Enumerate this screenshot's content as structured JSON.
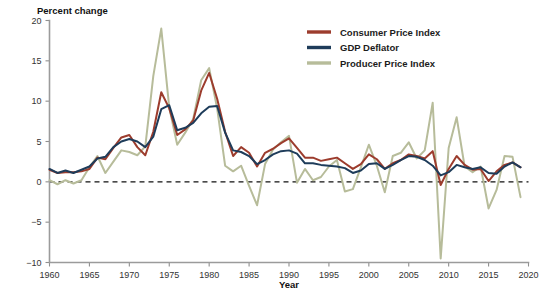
{
  "chart_data": {
    "type": "line",
    "title": "",
    "ylabel": "Percent change",
    "xlabel": "Year",
    "xlim": [
      1960,
      2020
    ],
    "ylim": [
      -10,
      20
    ],
    "xticks": [
      1960,
      1965,
      1970,
      1975,
      1980,
      1985,
      1990,
      1995,
      2000,
      2005,
      2010,
      2015,
      2020
    ],
    "yticks": [
      -10,
      -5,
      0,
      5,
      10,
      15,
      20
    ],
    "xtick_labels": [
      "1960",
      "1965",
      "1970",
      "1975",
      "1980",
      "1985",
      "1990",
      "1995",
      "2000",
      "2005",
      "2010",
      "2015",
      "2020"
    ],
    "ytick_labels": [
      "−10",
      "−5",
      "0",
      "5",
      "10",
      "15",
      "20"
    ],
    "grid": false,
    "zero_reference_line": 0,
    "legend_position": "top-right",
    "x": [
      1960,
      1961,
      1962,
      1963,
      1964,
      1965,
      1966,
      1967,
      1968,
      1969,
      1970,
      1971,
      1972,
      1973,
      1974,
      1975,
      1976,
      1977,
      1978,
      1979,
      1980,
      1981,
      1982,
      1983,
      1984,
      1985,
      1986,
      1987,
      1988,
      1989,
      1990,
      1991,
      1992,
      1993,
      1994,
      1995,
      1996,
      1997,
      1998,
      1999,
      2000,
      2001,
      2002,
      2003,
      2004,
      2005,
      2006,
      2007,
      2008,
      2009,
      2010,
      2011,
      2012,
      2013,
      2014,
      2015,
      2016,
      2017,
      2018,
      2019
    ],
    "series": [
      {
        "name": "Consumer Price Index",
        "color": "#9c3c2d",
        "values": [
          1.5,
          1.1,
          1.2,
          1.2,
          1.3,
          1.6,
          3.0,
          2.8,
          4.2,
          5.5,
          5.8,
          4.3,
          3.3,
          6.2,
          11.1,
          9.1,
          5.8,
          6.5,
          7.6,
          11.3,
          13.5,
          10.3,
          6.2,
          3.2,
          4.3,
          3.6,
          1.9,
          3.6,
          4.1,
          4.8,
          5.4,
          4.2,
          3.0,
          3.0,
          2.6,
          2.8,
          3.0,
          2.3,
          1.6,
          2.2,
          3.4,
          2.8,
          1.6,
          2.3,
          2.7,
          3.4,
          3.2,
          2.9,
          3.8,
          -0.4,
          1.6,
          3.2,
          2.1,
          1.5,
          1.6,
          0.1,
          1.3,
          2.1,
          2.4,
          1.8
        ]
      },
      {
        "name": "GDP Deflator",
        "color": "#1e3c5a",
        "values": [
          1.6,
          1.1,
          1.4,
          1.1,
          1.5,
          1.9,
          2.9,
          3.1,
          4.3,
          5.0,
          5.3,
          5.0,
          4.3,
          5.6,
          9.0,
          9.5,
          6.4,
          6.7,
          7.3,
          8.5,
          9.3,
          9.4,
          6.1,
          3.9,
          3.7,
          3.2,
          2.2,
          2.7,
          3.4,
          3.8,
          3.9,
          3.5,
          2.3,
          2.3,
          2.1,
          2.0,
          1.9,
          1.7,
          1.1,
          1.4,
          2.2,
          2.3,
          1.6,
          2.1,
          2.7,
          3.2,
          3.1,
          2.7,
          2.0,
          0.8,
          1.2,
          2.1,
          1.8,
          1.6,
          1.8,
          1.1,
          1.0,
          1.9,
          2.4,
          1.8
        ]
      },
      {
        "name": "Producer Price Index",
        "color": "#b7bc9a",
        "values": [
          0.2,
          -0.3,
          0.2,
          -0.2,
          0.2,
          1.8,
          3.2,
          1.1,
          2.5,
          3.9,
          3.7,
          3.3,
          4.4,
          13.1,
          19.0,
          9.2,
          4.6,
          6.1,
          7.8,
          12.6,
          14.1,
          9.1,
          2.0,
          1.3,
          2.0,
          -0.5,
          -2.9,
          2.2,
          4.0,
          4.9,
          5.7,
          -0.1,
          1.6,
          0.2,
          0.6,
          1.9,
          2.7,
          -1.2,
          -0.9,
          1.8,
          4.6,
          2.0,
          -1.3,
          3.2,
          3.6,
          4.9,
          2.9,
          3.9,
          9.8,
          -9.5,
          4.2,
          8.0,
          1.9,
          1.2,
          1.9,
          -3.3,
          -1.0,
          3.2,
          3.1,
          -1.9
        ]
      }
    ],
    "legend": [
      {
        "label": "Consumer Price Index",
        "color": "#9c3c2d"
      },
      {
        "label": "GDP Deflator",
        "color": "#1e3c5a"
      },
      {
        "label": "Producer Price Index",
        "color": "#b7bc9a"
      }
    ]
  }
}
